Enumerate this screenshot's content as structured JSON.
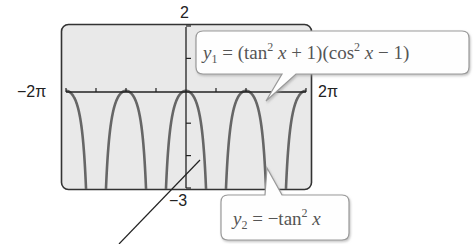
{
  "chart_data": {
    "type": "line",
    "title": "",
    "xlabel": "",
    "ylabel": "",
    "xlim": [
      "-2π",
      "2π"
    ],
    "ylim": [
      -3,
      2
    ],
    "x_tick_labels": {
      "min": "−2π",
      "max": "2π"
    },
    "y_tick_labels": {
      "max": "2",
      "min": "−3"
    },
    "x_ticks_count_each_side": 4,
    "y_ticks": [
      2,
      1,
      0,
      -1,
      -2,
      -3
    ],
    "grid": false,
    "background": "#e9e9e9",
    "series": [
      {
        "name": "y1",
        "label": "y₁ = (tan² x + 1)(cos² x − 1)",
        "function": "(tan^2 x + 1)(cos^2 x - 1)",
        "color": "#666666"
      },
      {
        "name": "y2",
        "label": "y₂ = −tan² x",
        "function": "-tan^2 x",
        "color": "#666666"
      }
    ],
    "annotations": [
      {
        "series": "y1",
        "text": "y₁ = (tan² x + 1)(cos² x − 1)"
      },
      {
        "series": "y2",
        "text": "y₂ = −tan² x"
      }
    ],
    "note": "Both series are identical (y1 simplifies to -tan^2 x); graph shows downward arches touching 0 at multiples of π with vertical asymptotes at odd multiples of π/2."
  },
  "labels": {
    "y_max": "2",
    "y_min": "−3",
    "x_min": "−2π",
    "x_max": "2π"
  },
  "callouts": {
    "y1": {
      "var": "y",
      "sub": "1",
      "expr_a": " = (tan",
      "sup_a": "2",
      "expr_b": " ",
      "x_a": "x",
      "expr_c": " + 1)(cos",
      "sup_b": "2",
      "expr_d": " ",
      "x_b": "x",
      "expr_e": " − 1)"
    },
    "y2": {
      "var": "y",
      "sub": "2",
      "expr_a": " = −tan",
      "sup_a": "2",
      "expr_b": " ",
      "x_a": "x"
    }
  }
}
